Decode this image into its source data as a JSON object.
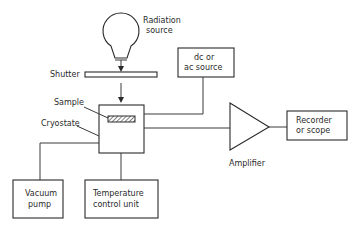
{
  "diagram": {
    "type": "block-diagram",
    "title": "",
    "nodes": [
      {
        "id": "radiation_source",
        "label_lines": [
          "Radiation",
          "source"
        ],
        "shape": "bulb"
      },
      {
        "id": "shutter",
        "label": "Shutter",
        "shape": "bar"
      },
      {
        "id": "cryostat",
        "label": "Cryostate",
        "shape": "box"
      },
      {
        "id": "sample",
        "label": "Sample",
        "shape": "hatched-rect"
      },
      {
        "id": "dc_ac_source",
        "label_lines": [
          "dc or",
          "ac source"
        ],
        "shape": "box"
      },
      {
        "id": "amplifier",
        "label": "Amplifier",
        "shape": "triangle"
      },
      {
        "id": "recorder",
        "label_lines": [
          "Recorder",
          "or scope"
        ],
        "shape": "box"
      },
      {
        "id": "vacuum_pump",
        "label_lines": [
          "Vacuum",
          "pump"
        ],
        "shape": "box"
      },
      {
        "id": "temperature_control",
        "label_lines": [
          "Temperature",
          "control unit"
        ],
        "shape": "box"
      }
    ],
    "edges": [
      {
        "from": "radiation_source",
        "to": "shutter",
        "arrow": true
      },
      {
        "from": "shutter",
        "to": "cryostat",
        "arrow": true
      },
      {
        "from": "dc_ac_source",
        "to": "cryostat",
        "arrow": false
      },
      {
        "from": "cryostat",
        "to": "amplifier",
        "arrow": false
      },
      {
        "from": "amplifier",
        "to": "recorder",
        "arrow": false
      },
      {
        "from": "cryostat",
        "to": "vacuum_pump",
        "arrow": false
      },
      {
        "from": "cryostat",
        "to": "temperature_control",
        "arrow": false
      }
    ]
  },
  "labels": {
    "radiation_1": "Radiation",
    "radiation_2": "source",
    "shutter": "Shutter",
    "sample": "Sample",
    "cryostat": "Cryostate",
    "dc_1": "dc or",
    "dc_2": "ac source",
    "amplifier": "Amplifier",
    "recorder_1": "Recorder",
    "recorder_2": "or scope",
    "vacuum_1": "Vacuum",
    "vacuum_2": "pump",
    "temp_1": "Temperature",
    "temp_2": "control unit"
  },
  "colors": {
    "line": "#3a3a3a",
    "background": "#ffffff"
  }
}
